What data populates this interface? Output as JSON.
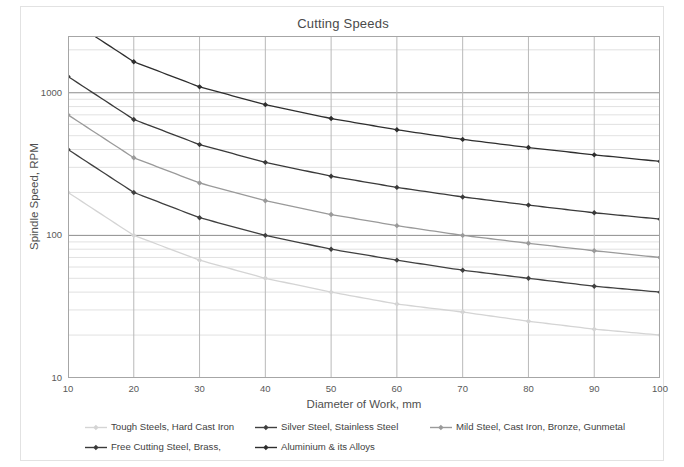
{
  "chart_data": {
    "type": "line",
    "title": "Cutting Speeds",
    "xlabel": "Diameter of Work, mm",
    "ylabel": "Spindle Speed, RPM",
    "xscale": "linear",
    "yscale": "log",
    "xlim": [
      10,
      100
    ],
    "ylim": [
      10,
      2500
    ],
    "grid": true,
    "legend_position": "bottom",
    "x": [
      10,
      20,
      30,
      40,
      50,
      60,
      70,
      80,
      90,
      100
    ],
    "xticks": [
      "10",
      "20",
      "30",
      "40",
      "50",
      "60",
      "70",
      "80",
      "90",
      "100"
    ],
    "yticks": [
      "10",
      "100",
      "1000"
    ],
    "ytick_values": [
      10,
      100,
      1000
    ],
    "series": [
      {
        "name": "Tough Steels, Hard Cast Iron",
        "color": "#d4d4d4",
        "marker": "diamond",
        "values": [
          200,
          100,
          67,
          50,
          40,
          33,
          29,
          25,
          22,
          20
        ]
      },
      {
        "name": "Silver Steel, Stainless Steel",
        "color": "#404040",
        "marker": "diamond",
        "values": [
          400,
          200,
          133,
          100,
          80,
          67,
          57,
          50,
          44,
          40
        ]
      },
      {
        "name": "Mild Steel, Cast Iron, Bronze, Gunmetal",
        "color": "#9a9a9a",
        "marker": "diamond",
        "values": [
          700,
          350,
          233,
          175,
          140,
          117,
          100,
          88,
          78,
          70
        ]
      },
      {
        "name": "Free Cutting Steel, Brass,",
        "color": "#3a3a3a",
        "marker": "diamond",
        "values": [
          1300,
          650,
          433,
          325,
          260,
          217,
          186,
          163,
          144,
          130
        ]
      },
      {
        "name": "Aluminium & its Alloys",
        "color": "#2e2e2e",
        "marker": "diamond",
        "values": [
          3300,
          1650,
          1100,
          825,
          660,
          550,
          471,
          413,
          367,
          330
        ]
      }
    ]
  },
  "legend": {
    "items": [
      {
        "label": "Tough Steels, Hard Cast Iron",
        "color": "#d4d4d4"
      },
      {
        "label": "Silver Steel, Stainless Steel",
        "color": "#404040"
      },
      {
        "label": "Mild Steel, Cast Iron, Bronze, Gunmetal",
        "color": "#9a9a9a"
      },
      {
        "label": "Free Cutting Steel, Brass,",
        "color": "#3a3a3a"
      },
      {
        "label": "Aluminium & its Alloys",
        "color": "#2e2e2e"
      }
    ]
  },
  "colors": {
    "frame": "#a6a6a6",
    "major_grid": "#8c8c8c",
    "minor_grid": "#d9d9d9",
    "text": "#4f4f4f",
    "background": "#ffffff"
  }
}
